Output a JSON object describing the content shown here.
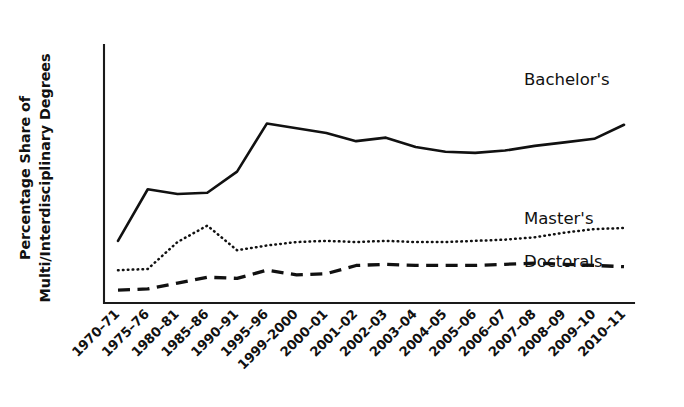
{
  "figure": {
    "background_color": "#ffffff",
    "ink_color": "#111111",
    "width": 684,
    "height": 407
  },
  "axes": {
    "y_axis_label_line1": "Percentage Share of",
    "y_axis_label_line2": "Multi/Interdisciplinary Degrees",
    "x_axis_label": "",
    "x_tick_rotation_degrees": 45
  },
  "series_labels": {
    "bachelors": "Bachelor's",
    "masters": "Master's",
    "doctorals": "Doctorals"
  },
  "chart_data": {
    "type": "line",
    "title": "",
    "xlabel": "",
    "ylabel": "Percentage Share of Multi/Interdisciplinary Degrees",
    "grid": false,
    "legend_position": "inline-right",
    "ylim": [
      0,
      2.2
    ],
    "categories": [
      "1970–71",
      "1975–76",
      "1980–81",
      "1985–86",
      "1990–91",
      "1995–96",
      "1999–2000",
      "2000–01",
      "2001–02",
      "2002–03",
      "2003–04",
      "2004–05",
      "2005–06",
      "2006–07",
      "2007–08",
      "2008–09",
      "2009–10",
      "2010–11"
    ],
    "series": [
      {
        "name": "Bachelor's",
        "line_style": "solid",
        "values": [
          0.53,
          0.97,
          0.93,
          0.94,
          1.12,
          1.53,
          1.49,
          1.45,
          1.38,
          1.41,
          1.33,
          1.29,
          1.28,
          1.3,
          1.34,
          1.37,
          1.4,
          1.52
        ]
      },
      {
        "name": "Master's",
        "line_style": "dotted",
        "values": [
          0.28,
          0.29,
          0.52,
          0.66,
          0.45,
          0.49,
          0.52,
          0.53,
          0.52,
          0.53,
          0.52,
          0.52,
          0.53,
          0.54,
          0.56,
          0.6,
          0.63,
          0.64
        ]
      },
      {
        "name": "Doctorals",
        "line_style": "dashed",
        "values": [
          0.11,
          0.12,
          0.17,
          0.22,
          0.21,
          0.28,
          0.24,
          0.25,
          0.32,
          0.33,
          0.32,
          0.32,
          0.32,
          0.33,
          0.34,
          0.33,
          0.32,
          0.31
        ]
      }
    ]
  },
  "plot_geometry": {
    "x_left": 104,
    "x_right": 634,
    "y_top": 45,
    "y_baseline": 303,
    "value_to_y_top": 0.0,
    "note": "pixel frame of the axes"
  }
}
